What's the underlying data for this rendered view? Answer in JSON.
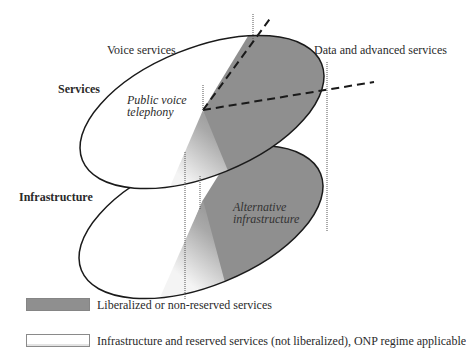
{
  "diagram": {
    "layers": [
      {
        "id": "services",
        "label": "Services"
      },
      {
        "id": "infrastructure",
        "label": "Infrastructure"
      }
    ],
    "regions": {
      "voice_services": "Voice services",
      "data_services": "Data and advanced services",
      "public_voice": "Public voice\ntelephony",
      "public_voice_line1": "Public voice",
      "public_voice_line2": "telephony",
      "alt_infra_line1": "Alternative",
      "alt_infra_line2": "infrastructure"
    },
    "colors": {
      "liberalized": "#8f8f8f",
      "reserved": "#ffffff",
      "outline": "#1a1a1a"
    }
  },
  "legend": {
    "items": [
      {
        "swatch": "dark",
        "label": "Liberalized or non-reserved services"
      },
      {
        "swatch": "light",
        "label": "Infrastructure and reserved services (not liberalized), ONP regime applicable"
      }
    ]
  }
}
